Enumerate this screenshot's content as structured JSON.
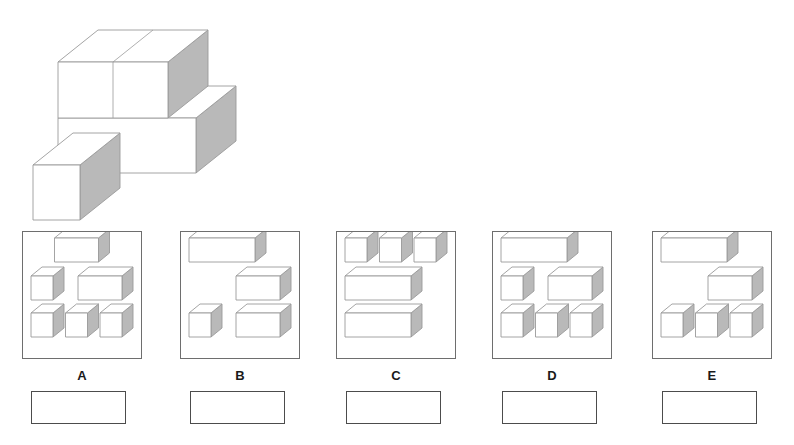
{
  "page": {
    "background_color": "#ffffff",
    "line_color": "#9a9a9a",
    "shade_color": "#b9b9b9",
    "frame_color": "#6e6e6e",
    "label_color": "#1a1a1a"
  },
  "stimulus": {
    "name": "3d-block-figure",
    "description": "Isometric figure built from unit cubes: a top layer bar, a middle layer bar and one detached cube at lower-left."
  },
  "options": [
    {
      "id": "A",
      "label": "A",
      "frame": {
        "x": 22,
        "y": 231,
        "w": 120,
        "h": 128
      },
      "label_pos": {
        "x": 22,
        "y": 368
      },
      "answer_box": {
        "x": 31,
        "y": 391,
        "w": 95,
        "h": 33
      },
      "answer_value": "",
      "answer_placeholder": "",
      "rows": [
        {
          "blocks": [
            {
              "len": 2
            }
          ],
          "align": "center"
        },
        {
          "blocks": [
            {
              "len": 1
            },
            {
              "len": 2
            }
          ],
          "align": "spread"
        },
        {
          "blocks": [
            {
              "len": 1
            },
            {
              "len": 1
            },
            {
              "len": 1
            }
          ],
          "align": "spread"
        }
      ]
    },
    {
      "id": "B",
      "label": "B",
      "frame": {
        "x": 180,
        "y": 231,
        "w": 120,
        "h": 128
      },
      "label_pos": {
        "x": 180,
        "y": 368
      },
      "answer_box": {
        "x": 190,
        "y": 391,
        "w": 95,
        "h": 33
      },
      "answer_value": "",
      "answer_placeholder": "",
      "rows": [
        {
          "blocks": [
            {
              "len": 3
            }
          ],
          "align": "left"
        },
        {
          "blocks": [
            {
              "len": 2
            }
          ],
          "align": "right"
        },
        {
          "blocks": [
            {
              "len": 1
            },
            {
              "len": 2
            }
          ],
          "align": "spread"
        }
      ]
    },
    {
      "id": "C",
      "label": "C",
      "frame": {
        "x": 336,
        "y": 231,
        "w": 120,
        "h": 128
      },
      "label_pos": {
        "x": 336,
        "y": 368
      },
      "answer_box": {
        "x": 346,
        "y": 391,
        "w": 95,
        "h": 33
      },
      "answer_value": "",
      "answer_placeholder": "",
      "rows": [
        {
          "blocks": [
            {
              "len": 1
            },
            {
              "len": 1
            },
            {
              "len": 1
            }
          ],
          "align": "spread"
        },
        {
          "blocks": [
            {
              "len": 3
            }
          ],
          "align": "left"
        },
        {
          "blocks": [
            {
              "len": 3
            }
          ],
          "align": "left"
        }
      ]
    },
    {
      "id": "D",
      "label": "D",
      "frame": {
        "x": 492,
        "y": 231,
        "w": 120,
        "h": 128
      },
      "label_pos": {
        "x": 492,
        "y": 368
      },
      "answer_box": {
        "x": 502,
        "y": 391,
        "w": 95,
        "h": 33
      },
      "answer_value": "",
      "answer_placeholder": "",
      "rows": [
        {
          "blocks": [
            {
              "len": 3
            }
          ],
          "align": "left"
        },
        {
          "blocks": [
            {
              "len": 1
            },
            {
              "len": 2
            }
          ],
          "align": "spread"
        },
        {
          "blocks": [
            {
              "len": 1
            },
            {
              "len": 1
            },
            {
              "len": 1
            }
          ],
          "align": "spread"
        }
      ]
    },
    {
      "id": "E",
      "label": "E",
      "frame": {
        "x": 652,
        "y": 231,
        "w": 120,
        "h": 128
      },
      "label_pos": {
        "x": 652,
        "y": 368
      },
      "answer_box": {
        "x": 662,
        "y": 391,
        "w": 95,
        "h": 33
      },
      "answer_value": "",
      "answer_placeholder": "",
      "rows": [
        {
          "blocks": [
            {
              "len": 3
            }
          ],
          "align": "left"
        },
        {
          "blocks": [
            {
              "len": 2
            }
          ],
          "align": "right"
        },
        {
          "blocks": [
            {
              "len": 1
            },
            {
              "len": 1
            },
            {
              "len": 1
            }
          ],
          "align": "spread"
        }
      ]
    }
  ]
}
